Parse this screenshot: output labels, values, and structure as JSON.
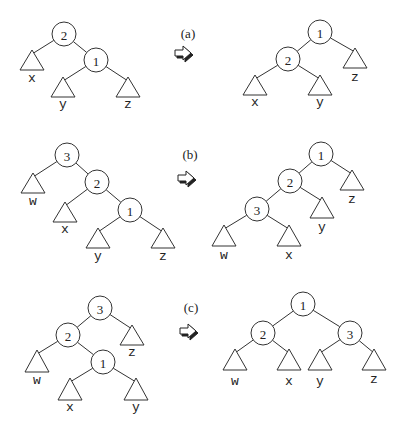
{
  "cases": [
    {
      "label": "(a)",
      "label_pos": [
        188,
        33
      ],
      "arrow_pos": [
        183,
        52
      ],
      "before": {
        "nodes": [
          {
            "id": "2",
            "x": 64,
            "y": 34
          },
          {
            "id": "1",
            "x": 96,
            "y": 60
          }
        ],
        "subtrees": [
          {
            "id": "x",
            "apex": [
              32,
              50
            ],
            "base_y": 70,
            "half": 12,
            "label_y": 78
          },
          {
            "id": "y",
            "apex": [
              63,
              77
            ],
            "base_y": 97,
            "half": 12,
            "label_y": 104
          },
          {
            "id": "z",
            "apex": [
              128,
              77
            ],
            "base_y": 97,
            "half": 12,
            "label_y": 104
          }
        ],
        "edges": [
          [
            "2",
            "x"
          ],
          [
            "2",
            "1"
          ],
          [
            "1",
            "y"
          ],
          [
            "1",
            "z"
          ]
        ]
      },
      "after": {
        "nodes": [
          {
            "id": "1",
            "x": 320,
            "y": 32
          },
          {
            "id": "2",
            "x": 288,
            "y": 59
          }
        ],
        "subtrees": [
          {
            "id": "z",
            "apex": [
              355,
              48
            ],
            "base_y": 68,
            "half": 12,
            "label_y": 77
          },
          {
            "id": "x",
            "apex": [
              255,
              75
            ],
            "base_y": 95,
            "half": 12,
            "label_y": 102
          },
          {
            "id": "y",
            "apex": [
              320,
              75
            ],
            "base_y": 95,
            "half": 12,
            "label_y": 102
          }
        ],
        "edges": [
          [
            "1",
            "2"
          ],
          [
            "1",
            "z"
          ],
          [
            "2",
            "x"
          ],
          [
            "2",
            "y"
          ]
        ]
      }
    },
    {
      "label": "(b)",
      "label_pos": [
        190,
        154
      ],
      "arrow_pos": [
        186,
        177
      ],
      "before": {
        "nodes": [
          {
            "id": "3",
            "x": 67,
            "y": 155
          },
          {
            "id": "2",
            "x": 97,
            "y": 182
          },
          {
            "id": "1",
            "x": 130,
            "y": 210
          }
        ],
        "subtrees": [
          {
            "id": "w",
            "apex": [
              33,
              173
            ],
            "base_y": 193,
            "half": 12,
            "label_y": 201
          },
          {
            "id": "x",
            "apex": [
              65,
              202
            ],
            "base_y": 222,
            "half": 12,
            "label_y": 229
          },
          {
            "id": "y",
            "apex": [
              98,
              228
            ],
            "base_y": 248,
            "half": 12,
            "label_y": 256
          },
          {
            "id": "z",
            "apex": [
              163,
              228
            ],
            "base_y": 248,
            "half": 12,
            "label_y": 256
          }
        ],
        "edges": [
          [
            "3",
            "w"
          ],
          [
            "3",
            "2"
          ],
          [
            "2",
            "x"
          ],
          [
            "2",
            "1"
          ],
          [
            "1",
            "y"
          ],
          [
            "1",
            "z"
          ]
        ]
      },
      "after": {
        "nodes": [
          {
            "id": "1",
            "x": 321,
            "y": 154
          },
          {
            "id": "2",
            "x": 290,
            "y": 181
          },
          {
            "id": "3",
            "x": 257,
            "y": 209
          }
        ],
        "subtrees": [
          {
            "id": "z",
            "apex": [
              352,
              170
            ],
            "base_y": 190,
            "half": 12,
            "label_y": 199
          },
          {
            "id": "y",
            "apex": [
              322,
              197
            ],
            "base_y": 218,
            "half": 12,
            "label_y": 227
          },
          {
            "id": "w",
            "apex": [
              224,
              225
            ],
            "base_y": 246,
            "half": 12,
            "label_y": 255
          },
          {
            "id": "x",
            "apex": [
              289,
              225
            ],
            "base_y": 246,
            "half": 12,
            "label_y": 255
          }
        ],
        "edges": [
          [
            "1",
            "2"
          ],
          [
            "1",
            "z"
          ],
          [
            "2",
            "3"
          ],
          [
            "2",
            "y"
          ],
          [
            "3",
            "w"
          ],
          [
            "3",
            "x"
          ]
        ]
      }
    },
    {
      "label": "(c)",
      "label_pos": [
        191,
        307
      ],
      "arrow_pos": [
        188,
        330
      ],
      "before": {
        "nodes": [
          {
            "id": "3",
            "x": 100,
            "y": 308
          },
          {
            "id": "2",
            "x": 68,
            "y": 335
          },
          {
            "id": "1",
            "x": 103,
            "y": 362
          }
        ],
        "subtrees": [
          {
            "id": "z",
            "apex": [
              132,
              325
            ],
            "base_y": 345,
            "half": 12,
            "label_y": 352
          },
          {
            "id": "w",
            "apex": [
              37,
              350
            ],
            "base_y": 372,
            "half": 12,
            "label_y": 380
          },
          {
            "id": "x",
            "apex": [
              70,
              378
            ],
            "base_y": 400,
            "half": 12,
            "label_y": 407
          },
          {
            "id": "y",
            "apex": [
              136,
              378
            ],
            "base_y": 400,
            "half": 12,
            "label_y": 407
          }
        ],
        "edges": [
          [
            "3",
            "2"
          ],
          [
            "3",
            "z"
          ],
          [
            "2",
            "w"
          ],
          [
            "2",
            "1"
          ],
          [
            "1",
            "x"
          ],
          [
            "1",
            "y"
          ]
        ]
      },
      "after": {
        "nodes": [
          {
            "id": "1",
            "x": 303,
            "y": 304
          },
          {
            "id": "2",
            "x": 263,
            "y": 333
          },
          {
            "id": "3",
            "x": 350,
            "y": 333
          }
        ],
        "subtrees": [
          {
            "id": "w",
            "apex": [
              235,
              349
            ],
            "base_y": 370,
            "half": 12,
            "label_y": 381
          },
          {
            "id": "x",
            "apex": [
              289,
              349
            ],
            "base_y": 370,
            "half": 12,
            "label_y": 381
          },
          {
            "id": "y",
            "apex": [
              320,
              349
            ],
            "base_y": 370,
            "half": 12,
            "label_y": 381
          },
          {
            "id": "z",
            "apex": [
              374,
              349
            ],
            "base_y": 370,
            "half": 12,
            "label_y": 379
          }
        ],
        "edges": [
          [
            "1",
            "2"
          ],
          [
            "1",
            "3"
          ],
          [
            "2",
            "w"
          ],
          [
            "2",
            "x"
          ],
          [
            "3",
            "y"
          ],
          [
            "3",
            "z"
          ]
        ]
      }
    }
  ],
  "style": {
    "node_radius": 12,
    "stroke": "#333333",
    "background": "#ffffff"
  }
}
